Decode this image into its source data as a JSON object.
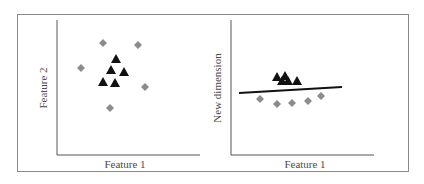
{
  "figure": {
    "panels": [
      {
        "id": "left",
        "title": "",
        "xlabel": "Feature 1",
        "ylabel": "Feature 2",
        "description": "Original 2D feature space: triangles clustered in center, diamonds scattered around them"
      },
      {
        "id": "right",
        "title": "",
        "xlabel": "Feature 1",
        "ylabel": "New dimension",
        "description": "Transformed space: a line separates triangles (above) from diamonds (below)"
      }
    ],
    "colors": {
      "frame": "#8a8a8a",
      "axis": "#555555",
      "diamond": "#8c8c8c",
      "triangle": "#111111",
      "separator_line": "#111111",
      "label_text": "#4a4a4a"
    },
    "legend": {
      "class_a_marker": "gray diamond",
      "class_b_marker": "black triangle"
    }
  },
  "chart_data": [
    {
      "type": "scatter",
      "title": "",
      "xlabel": "Feature 1",
      "ylabel": "Feature 2",
      "grid": false,
      "ticks": false,
      "series": [
        {
          "name": "diamond",
          "marker": "diamond",
          "color": "#8c8c8c",
          "points": [
            [
              103,
              43
            ],
            [
              138,
              45
            ],
            [
              81,
              68
            ],
            [
              145,
              87
            ],
            [
              110,
              108
            ]
          ]
        },
        {
          "name": "triangle",
          "marker": "triangle",
          "color": "#111111",
          "points": [
            [
              116,
              59
            ],
            [
              111,
              70
            ],
            [
              124,
              72
            ],
            [
              103,
              82
            ],
            [
              115,
              83
            ]
          ]
        }
      ]
    },
    {
      "type": "scatter",
      "title": "",
      "xlabel": "Feature 1",
      "ylabel": "New dimension",
      "grid": false,
      "ticks": false,
      "series": [
        {
          "name": "triangle",
          "marker": "triangle",
          "color": "#111111",
          "points": [
            [
              277,
              77
            ],
            [
              285,
              76
            ],
            [
              282,
              81
            ],
            [
              288,
              81
            ],
            [
              297,
              81
            ]
          ]
        },
        {
          "name": "diamond",
          "marker": "diamond",
          "color": "#8c8c8c",
          "points": [
            [
              260,
              99
            ],
            [
              277,
              104
            ],
            [
              292,
              103
            ],
            [
              308,
              101
            ],
            [
              321,
              96
            ]
          ]
        }
      ],
      "separator_line": {
        "from": [
          239,
          93
        ],
        "to": [
          342,
          87
        ]
      }
    }
  ]
}
